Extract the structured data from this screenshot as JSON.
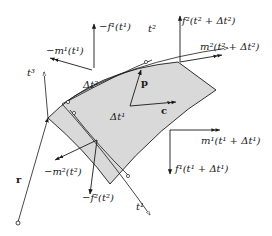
{
  "diagram": {
    "colors": {
      "surface_fill": "#d9d9d9",
      "line": "#1a1a1a",
      "background": "#ffffff"
    },
    "labels": {
      "neg_f1": "−f¹(t¹)",
      "neg_m1": "−m¹(t¹)",
      "t3": "t³",
      "t2": "t²",
      "t1": "t¹",
      "f2_plus": "f²(t² + Δt²)",
      "m2_plus": "m²(t² + Δt²)",
      "delta_t2": "Δt²",
      "delta_t1": "Δt¹",
      "p": "p",
      "c": "c",
      "m1_plus": "m¹(t¹ + Δt¹)",
      "f1_plus": "f¹(t¹ + Δt¹)",
      "neg_m2": "−m²(t²)",
      "neg_f2": "−f²(t²)",
      "r": "r"
    }
  }
}
